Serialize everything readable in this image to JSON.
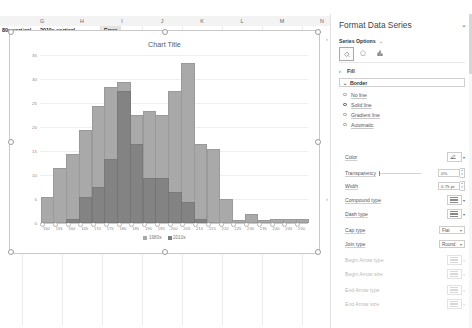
{
  "sheet": {
    "columns": [
      "G",
      "H",
      "I",
      "J",
      "K",
      "L",
      "M",
      "N"
    ],
    "header_row": [
      {
        "text": "80s-vertical",
        "selected": false
      },
      {
        "text": "2010s-vertical",
        "selected": false
      },
      {
        "text": "Error",
        "selected": true
      }
    ]
  },
  "chart_data": {
    "type": "bar",
    "title": "Chart Title",
    "xlabel": "",
    "ylabel": "",
    "ylim": [
      0,
      35
    ],
    "grid": true,
    "legend_position": "bottom",
    "categories": [
      "150",
      "155",
      "160",
      "165",
      "170",
      "175",
      "180",
      "185",
      "190",
      "195",
      "200",
      "205",
      "210",
      "215",
      "220",
      "225",
      "230",
      "235",
      "240",
      "245",
      "250"
    ],
    "series": [
      {
        "name": "1980s",
        "color": "#a9a9a9",
        "values": [
          5,
          11,
          14,
          19,
          24,
          28,
          29,
          22,
          23,
          22,
          27,
          33,
          16,
          15,
          4.5,
          0.3,
          1.5,
          0.3,
          0.5,
          0.5,
          0.4
        ]
      },
      {
        "name": "2010s",
        "color": "#7e7e7e",
        "values": [
          0,
          0,
          0.4,
          5,
          7,
          13,
          27,
          16,
          9,
          9,
          6,
          4,
          0.5,
          0,
          0,
          0,
          0,
          0,
          0,
          0,
          0
        ]
      }
    ],
    "yticks": [
      "0",
      "5",
      "10",
      "15",
      "20",
      "25",
      "30",
      "35"
    ]
  },
  "pane": {
    "title": "Format Data Series",
    "collapse_chevron": "⌄",
    "subtitle": "Series Options",
    "subtitle_chevron": "⌄",
    "tabs": [
      {
        "name": "fill-line-tab",
        "icon": "paint-bucket-icon",
        "active": true
      },
      {
        "name": "effects-tab",
        "icon": "pentagon-effects-icon",
        "active": false
      },
      {
        "name": "series-options-tab",
        "icon": "bar-chart-icon",
        "active": false
      }
    ],
    "sections": [
      {
        "label": "Fill",
        "expanded": false,
        "marker": "›"
      },
      {
        "label": "Border",
        "expanded": true,
        "marker": "⌄"
      }
    ],
    "border_options": [
      {
        "label": "No line",
        "selected": false
      },
      {
        "label": "Solid line",
        "selected": true
      },
      {
        "label": "Gradient line",
        "selected": false
      },
      {
        "label": "Automatic",
        "selected": false
      }
    ],
    "fields": [
      {
        "label": "Color",
        "kind": "color",
        "value": "",
        "dim": false
      },
      {
        "label": "Transparency",
        "kind": "slider",
        "value": "0%",
        "dim": false
      },
      {
        "label": "Width",
        "kind": "number",
        "value": "0.75 pt",
        "dim": false
      },
      {
        "label": "Compound type",
        "kind": "icon",
        "value": "",
        "dim": false
      },
      {
        "label": "Dash type",
        "kind": "icon",
        "value": "",
        "dim": false
      },
      {
        "label": "Cap type",
        "kind": "combo",
        "value": "Flat",
        "dim": false
      },
      {
        "label": "Join type",
        "kind": "combo",
        "value": "Round",
        "dim": false
      },
      {
        "label": "Begin Arrow type",
        "kind": "icon",
        "value": "",
        "dim": true
      },
      {
        "label": "Begin Arrow size",
        "kind": "icon",
        "value": "",
        "dim": true
      },
      {
        "label": "End Arrow type",
        "kind": "icon",
        "value": "",
        "dim": true
      },
      {
        "label": "End Arrow size",
        "kind": "icon",
        "value": "",
        "dim": true
      }
    ]
  }
}
